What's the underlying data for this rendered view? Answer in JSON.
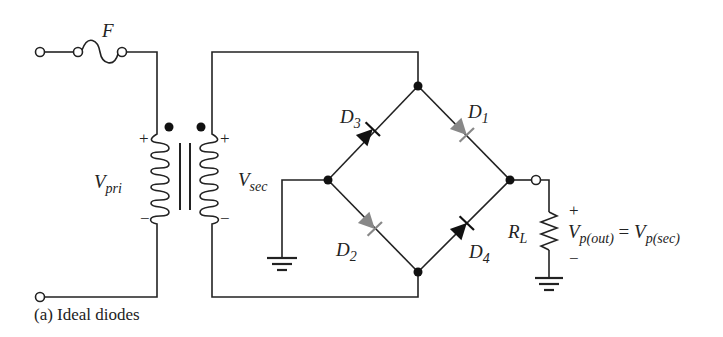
{
  "figure": {
    "caption": "(a) Ideal diodes",
    "colors": {
      "wire": "#222222",
      "conducting_diode": "#888888",
      "blocking_diode": "#111111"
    }
  },
  "labels": {
    "fuse": "F",
    "v_pri": {
      "main": "V",
      "sub": "pri"
    },
    "v_sec": {
      "main": "V",
      "sub": "sec"
    },
    "d1": {
      "main": "D",
      "sub": "1"
    },
    "d2": {
      "main": "D",
      "sub": "2"
    },
    "d3": {
      "main": "D",
      "sub": "3"
    },
    "d4": {
      "main": "D",
      "sub": "4"
    },
    "rl": {
      "main": "R",
      "sub": "L"
    },
    "vout_left": {
      "main": "V",
      "sub": "p(out)"
    },
    "equals": "=",
    "vout_right": {
      "main": "V",
      "sub": "p(sec)"
    }
  },
  "polarity": {
    "pri_plus": "+",
    "pri_minus": "−",
    "sec_plus": "+",
    "sec_minus": "−",
    "out_plus": "+",
    "out_minus": "−"
  },
  "components": [
    {
      "id": "fuse",
      "type": "fuse"
    },
    {
      "id": "transformer",
      "type": "transformer"
    },
    {
      "id": "D1",
      "type": "diode",
      "state": "conducting"
    },
    {
      "id": "D2",
      "type": "diode",
      "state": "conducting"
    },
    {
      "id": "D3",
      "type": "diode",
      "state": "blocking"
    },
    {
      "id": "D4",
      "type": "diode",
      "state": "blocking"
    },
    {
      "id": "RL",
      "type": "resistor"
    },
    {
      "id": "GND1",
      "type": "ground"
    },
    {
      "id": "GND2",
      "type": "ground"
    }
  ]
}
